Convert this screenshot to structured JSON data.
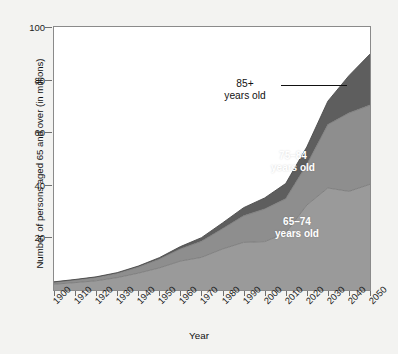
{
  "chart_data": {
    "type": "area",
    "stacked": true,
    "title": "",
    "xlabel": "Year",
    "ylabel": "Number of persons aged 65 and over (in millions)",
    "xlim": [
      1900,
      2050
    ],
    "ylim": [
      0,
      100
    ],
    "grid": false,
    "legend_position": "in-plot-annotations",
    "x": [
      1900,
      1910,
      1920,
      1930,
      1940,
      1950,
      1960,
      1970,
      1980,
      1990,
      2000,
      2010,
      2020,
      2030,
      2040,
      2050
    ],
    "xticklabels": [
      "1900",
      "1910",
      "1920",
      "1930",
      "1940",
      "1950",
      "1960",
      "1970",
      "1980",
      "1990",
      "2000",
      "2010",
      "2020",
      "2030",
      "2040",
      "2050"
    ],
    "yticklabels": [
      "20",
      "40",
      "60",
      "80",
      "100"
    ],
    "yticks": [
      20,
      40,
      60,
      80,
      100
    ],
    "series": [
      {
        "name": "65–74 years old",
        "color": "#9a9a9a",
        "values": [
          2.2,
          2.8,
          3.5,
          4.7,
          6.4,
          8.4,
          11.0,
          12.4,
          15.6,
          18.1,
          18.4,
          21.7,
          32.3,
          38.8,
          37.5,
          40.2
        ]
      },
      {
        "name": "75–84 years old",
        "color": "#8e8e8e",
        "values": [
          0.8,
          1.0,
          1.3,
          1.6,
          2.3,
          3.3,
          4.6,
          6.1,
          7.7,
          10.1,
          12.4,
          13.0,
          15.4,
          24.1,
          29.8,
          30.1
        ]
      },
      {
        "name": "85+ years old",
        "color": "#5e5e5e",
        "values": [
          0.1,
          0.2,
          0.2,
          0.3,
          0.4,
          0.6,
          0.9,
          1.4,
          2.2,
          3.1,
          4.2,
          5.8,
          6.7,
          8.9,
          14.2,
          19.4
        ]
      }
    ],
    "totals": [
      3.1,
      4.0,
      5.0,
      6.6,
      9.1,
      12.3,
      16.5,
      19.9,
      25.5,
      31.3,
      35.0,
      40.5,
      54.4,
      71.8,
      81.5,
      89.7
    ],
    "annotations": [
      {
        "text": "85+\nyears old",
        "target_series": "85+ years old",
        "has_leader_line": true
      },
      {
        "text": "75–84\nyears old",
        "target_series": "75–84 years old",
        "has_leader_line": false
      },
      {
        "text": "65–74\nyears old",
        "target_series": "65–74 years old",
        "has_leader_line": false
      }
    ]
  },
  "axes": {
    "y_title": "Number of persons aged 65 and over (in millions)",
    "x_title": "Year"
  },
  "labels": {
    "band_85_plus": "85+\nyears old",
    "band_75_84": "75–84\nyears old",
    "band_65_74": "65–74\nyears old"
  },
  "colors": {
    "band_65_74": "#9a9a9a",
    "band_75_84": "#8e8e8e",
    "band_85_plus": "#5e5e5e",
    "plot_background": "#ffffff",
    "figure_background": "#f3f3f1",
    "axis": "#8a8a8a",
    "text": "#1c1c1c"
  }
}
